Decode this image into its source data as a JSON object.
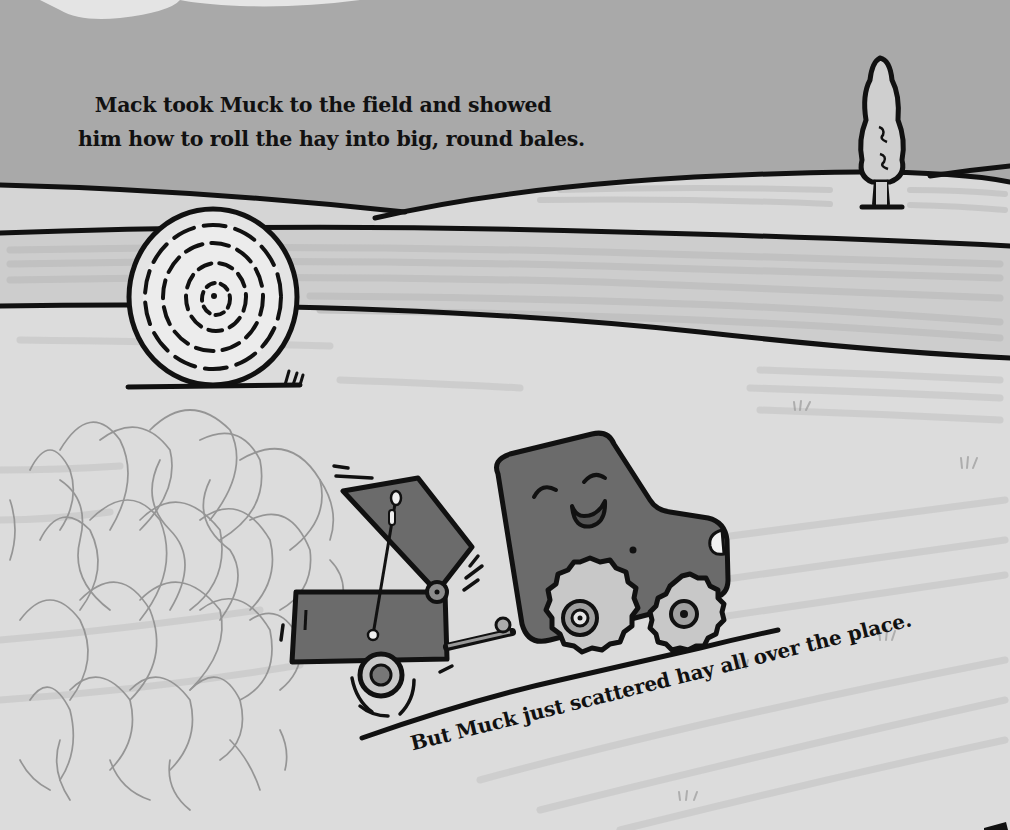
{
  "page": {
    "type": "picture-book-page",
    "story_text": {
      "top": [
        "Mack took Muck to the field and showed",
        "him how to roll the hay into big, round bales."
      ],
      "bottom": "But Muck just scattered hay all over the place."
    },
    "illustration": {
      "elements": [
        "rolling-hills",
        "cypress-tree",
        "round-hay-bale",
        "scattered-hay-pile",
        "smiling-tractor-muck",
        "hay-baler-trailer"
      ],
      "palette": {
        "sky": "#a9a9a9",
        "far_field": "#d6d6d6",
        "mid_field": "#cfcfcf",
        "near_field": "#dddddd",
        "field_stripe": "#c4c4c4",
        "outline": "#111111",
        "tractor_body": "#6b6b6b",
        "wheel": "#c8c8c8",
        "hay": "#8a8a8a",
        "scan_glare": "#f4f4f4"
      }
    }
  }
}
